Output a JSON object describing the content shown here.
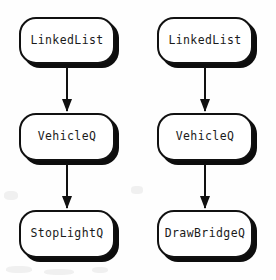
{
  "diagram": {
    "type": "flowchart",
    "orientation": "vertical",
    "background_color": "#fefefe",
    "node_fill_color": "#ffffff",
    "node_border_color": "#111111",
    "shadow_color": "#0d0d0d",
    "arrow_color": "#111111",
    "chains": [
      {
        "name": "stoplight-chain",
        "nodes": [
          {
            "label": "LinkedList"
          },
          {
            "label": "VehicleQ"
          },
          {
            "label": "StopLightQ"
          }
        ],
        "edges": [
          {
            "from": "LinkedList",
            "to": "VehicleQ",
            "style": "solid-arrow-down"
          },
          {
            "from": "VehicleQ",
            "to": "StopLightQ",
            "style": "solid-arrow-down"
          }
        ]
      },
      {
        "name": "drawbridge-chain",
        "nodes": [
          {
            "label": "LinkedList"
          },
          {
            "label": "VehicleQ"
          },
          {
            "label": "DrawBridgeQ"
          }
        ],
        "edges": [
          {
            "from": "LinkedList",
            "to": "VehicleQ",
            "style": "solid-arrow-down"
          },
          {
            "from": "VehicleQ",
            "to": "DrawBridgeQ",
            "style": "solid-arrow-down"
          }
        ]
      }
    ]
  }
}
